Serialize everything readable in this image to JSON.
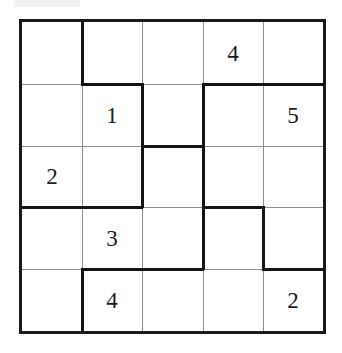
{
  "puzzle": {
    "kind": "number-grid-puzzle",
    "rows": 5,
    "cols": 5,
    "grid": [
      [
        "",
        "",
        "",
        "4",
        ""
      ],
      [
        "",
        "1",
        "",
        "",
        "5"
      ],
      [
        "2",
        "",
        "",
        "",
        ""
      ],
      [
        "",
        "3",
        "",
        "",
        ""
      ],
      [
        "",
        "4",
        "",
        "",
        "2"
      ]
    ],
    "colors": {
      "thin_line": "#8e8e8e",
      "thick_line": "#141414",
      "outer_border": "#1a1a1a",
      "digit": "#1b1b1b",
      "background": "#ffffff"
    },
    "thick_vertical_edges": [
      {
        "row": 1,
        "left_col": 1
      },
      {
        "row": 5,
        "left_col": 1
      },
      {
        "row": 2,
        "left_col": 2
      },
      {
        "row": 3,
        "left_col": 2
      },
      {
        "row": 2,
        "left_col": 3
      },
      {
        "row": 3,
        "left_col": 3
      },
      {
        "row": 4,
        "left_col": 3
      },
      {
        "row": 4,
        "left_col": 4
      }
    ],
    "thick_horizontal_edges": [
      {
        "col": 2,
        "top_row": 1
      },
      {
        "col": 4,
        "top_row": 1
      },
      {
        "col": 5,
        "top_row": 1
      },
      {
        "col": 3,
        "top_row": 2
      },
      {
        "col": 1,
        "top_row": 3
      },
      {
        "col": 2,
        "top_row": 3
      },
      {
        "col": 4,
        "top_row": 3
      },
      {
        "col": 2,
        "top_row": 4
      },
      {
        "col": 3,
        "top_row": 4
      },
      {
        "col": 5,
        "top_row": 4
      }
    ]
  }
}
